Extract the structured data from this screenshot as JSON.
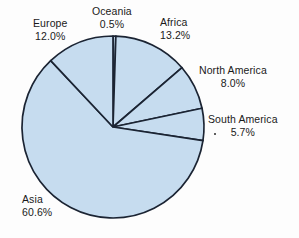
{
  "chart_data": {
    "type": "pie",
    "title": "",
    "categories": [
      "Oceania",
      "Africa",
      "North America",
      "South America",
      "Asia",
      "Europe"
    ],
    "values": [
      0.5,
      13.2,
      8.0,
      5.7,
      60.6,
      12.0
    ],
    "unit": "%",
    "start_angle_deg": 0,
    "direction": "clockwise",
    "legend": "none",
    "labels_position": "outside",
    "slice_fill": "#c6dcef",
    "slice_stroke": "#1b2433",
    "background": "#fdfdfd",
    "slices": [
      {
        "name": "Oceania",
        "percent_label": "0.5%",
        "value": 0.5
      },
      {
        "name": "Africa",
        "percent_label": "13.2%",
        "value": 13.2
      },
      {
        "name": "North America",
        "percent_label": "8.0%",
        "value": 8.0
      },
      {
        "name": "South America",
        "percent_label": "5.7%",
        "value": 5.7
      },
      {
        "name": "Asia",
        "percent_label": "60.6%",
        "value": 60.6
      },
      {
        "name": "Europe",
        "percent_label": "12.0%",
        "value": 12.0
      }
    ]
  },
  "labels": {
    "europe": {
      "name": "Europe",
      "percent": "12.0%"
    },
    "oceania": {
      "name": "Oceania",
      "percent": "0.5%"
    },
    "africa": {
      "name": "Africa",
      "percent": "13.2%"
    },
    "north_america": {
      "name": "North America",
      "percent": "8.0%"
    },
    "south_america": {
      "name": "South America",
      "percent": "5.7%"
    },
    "asia": {
      "name": "Asia",
      "percent": "60.6%"
    }
  },
  "geometry": {
    "center_x": 113,
    "center_y": 127,
    "radius": 91
  }
}
